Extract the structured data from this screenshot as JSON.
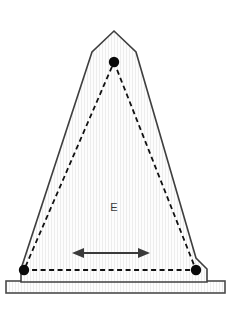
{
  "figure": {
    "name": "triangular-plate-diagram",
    "canvas": {
      "width": 232,
      "height": 310,
      "background": "#ffffff"
    },
    "labels": {
      "region_label": "E"
    },
    "colors": {
      "outline": "#3f3f3f",
      "fill": "#fdfdfd",
      "stripe": "#ededed",
      "dashed_line": "#111111",
      "vertex_dot": "#0a0a0a",
      "arrow": "#3a3a3a",
      "label_text": "#3a3a3a",
      "base_frame": "#4a4a4a"
    },
    "geometry": {
      "outer_shape": {
        "name": "tent-outline",
        "points": "114,31 136,52 196,258 207,269 207,282 21,282 21,269 92,52",
        "stroke_width": 1.6
      },
      "base_frame": {
        "name": "base-rectangle",
        "x": 6,
        "y": 281,
        "width": 219,
        "height": 12,
        "stroke_width": 1.6
      },
      "dashed_triangle": {
        "name": "inner-dashed-triangle",
        "points": "114,62 196,270 24,270",
        "stroke_width": 1.8,
        "dash_pattern": "5,3.5"
      },
      "vertices": [
        {
          "name": "apex-vertex",
          "cx": 114,
          "cy": 62,
          "r": 5.2
        },
        {
          "name": "bottom-left-vertex",
          "cx": 24,
          "cy": 270,
          "r": 5.2
        },
        {
          "name": "bottom-right-vertex",
          "cx": 196,
          "cy": 270,
          "r": 5.2
        }
      ],
      "dimension_arrow": {
        "name": "horizontal-double-arrow",
        "x1": 74,
        "x2": 148,
        "y": 253,
        "stroke_width": 1.9,
        "head_length": 10,
        "head_half_width": 5
      },
      "region_label_position": {
        "x": 114,
        "y": 211
      }
    }
  }
}
